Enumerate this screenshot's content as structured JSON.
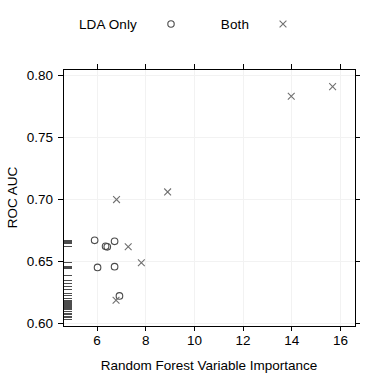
{
  "chart_data": {
    "type": "scatter",
    "title": "",
    "xlabel": "Random Forest Variable Importance",
    "ylabel": "ROC AUC",
    "xlim": [
      4.6,
      16.6
    ],
    "ylim": [
      0.598,
      0.805
    ],
    "xticks": [
      6,
      8,
      10,
      12,
      14,
      16
    ],
    "xticklabels": [
      "6",
      "8",
      "10",
      "12",
      "14",
      "16"
    ],
    "yticks": [
      0.6,
      0.65,
      0.7,
      0.75,
      0.8
    ],
    "yticklabels": [
      "0.60",
      "0.65",
      "0.70",
      "0.75",
      "0.80"
    ],
    "grid": true,
    "legend_position": "top-center",
    "series": [
      {
        "name": "LDA Only",
        "marker": "circle",
        "color": "#4a4a4a",
        "points": [
          {
            "x": 5.9,
            "y": 0.667
          },
          {
            "x": 6.35,
            "y": 0.6622
          },
          {
            "x": 6.42,
            "y": 0.6618
          },
          {
            "x": 6.72,
            "y": 0.6662
          },
          {
            "x": 6.02,
            "y": 0.6452
          },
          {
            "x": 6.72,
            "y": 0.6458
          },
          {
            "x": 6.92,
            "y": 0.6222
          }
        ]
      },
      {
        "name": "Both",
        "marker": "cross",
        "color": "#707070",
        "points": [
          {
            "x": 6.8,
            "y": 0.6998
          },
          {
            "x": 7.28,
            "y": 0.6618
          },
          {
            "x": 7.82,
            "y": 0.649
          },
          {
            "x": 8.9,
            "y": 0.706
          },
          {
            "x": 13.98,
            "y": 0.783
          },
          {
            "x": 15.68,
            "y": 0.7908
          },
          {
            "x": 6.78,
            "y": 0.6188
          }
        ]
      }
    ],
    "rug": {
      "axis": "y",
      "side": "left",
      "values": [
        0.6672,
        0.6662,
        0.665,
        0.6645,
        0.6622,
        0.6618,
        0.649,
        0.6458,
        0.6452,
        0.644,
        0.639,
        0.635,
        0.6322,
        0.6298,
        0.627,
        0.6242,
        0.6222,
        0.62,
        0.6188,
        0.6175,
        0.6168,
        0.616,
        0.6152,
        0.6145,
        0.6138,
        0.613,
        0.6122,
        0.6115,
        0.6098,
        0.6082,
        0.607,
        0.6058,
        0.6046,
        0.6035
      ]
    }
  },
  "legend": {
    "entries": [
      {
        "label": "LDA Only",
        "marker": "circle"
      },
      {
        "label": "Both",
        "marker": "cross"
      }
    ]
  }
}
